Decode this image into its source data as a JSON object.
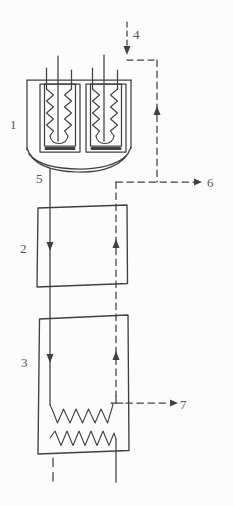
{
  "diagram": {
    "type": "process-flow-diagram",
    "background": "#fcfcfc",
    "colors": {
      "line": "#414141",
      "label": "#575757"
    },
    "labels": {
      "unit1": "1",
      "unit2": "2",
      "unit3": "3",
      "stream4": "4",
      "stream5": "5",
      "stream6": "6",
      "stream7": "7"
    }
  }
}
